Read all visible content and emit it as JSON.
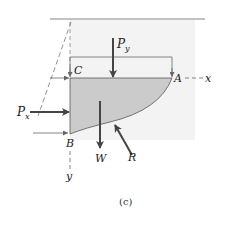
{
  "figure": {
    "caption": "(c)",
    "points": {
      "A": "A",
      "B": "B",
      "C": "C"
    },
    "axes": {
      "x": "x",
      "y": "y"
    },
    "forces": {
      "Py": {
        "base": "P",
        "sub": "y"
      },
      "Px": {
        "base": "P",
        "sub": "x"
      },
      "W": "W",
      "R": "R"
    },
    "colors": {
      "shade": "#c9c9c9",
      "line": "#555555",
      "arrow": "#444444",
      "background_band": "#f1f1f1"
    }
  }
}
